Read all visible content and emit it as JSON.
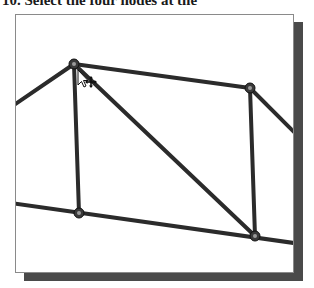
{
  "caption": {
    "text": "10. Select the four nodes at the"
  },
  "viewport": {
    "background": "#ffffff",
    "border_color": "#8a8a8a",
    "shadow_color": "#4a4a4a"
  },
  "model": {
    "line_color": "#2b2b2b",
    "node_fill": "#3a3a3a",
    "node_highlight": "#9a9a9a",
    "nodes": [
      {
        "id": "top-left",
        "x": 73,
        "y": 63
      },
      {
        "id": "top-right",
        "x": 249,
        "y": 87
      },
      {
        "id": "bottom-left",
        "x": 78,
        "y": 212
      },
      {
        "id": "bottom-right",
        "x": 254,
        "y": 235
      }
    ],
    "members": [
      {
        "id": "left-extension",
        "from": "edge-left-upper",
        "to": "top-left"
      },
      {
        "id": "top-chord",
        "from": "top-left",
        "to": "top-right"
      },
      {
        "id": "right-extension",
        "from": "top-right",
        "to": "edge-right-upper"
      },
      {
        "id": "left-vertical",
        "from": "top-left",
        "to": "bottom-left"
      },
      {
        "id": "right-vertical",
        "from": "top-right",
        "to": "bottom-right"
      },
      {
        "id": "diagonal",
        "from": "top-left",
        "to": "bottom-right"
      },
      {
        "id": "bottom-chord",
        "from": "edge-left-lower",
        "to": "edge-right-lower"
      }
    ]
  },
  "cursor": {
    "type": "select-move-cursor",
    "x": 86,
    "y": 78
  }
}
